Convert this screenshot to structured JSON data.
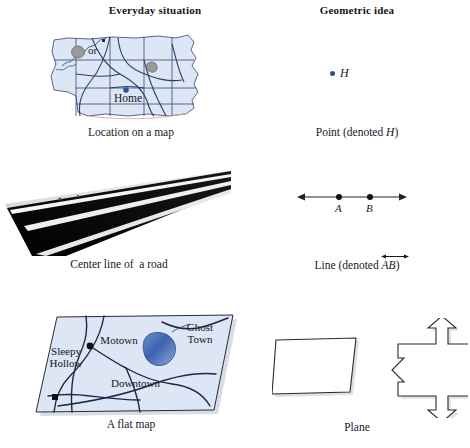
{
  "headers": {
    "everyday": "Everyday situation",
    "geometric": "Geometric idea"
  },
  "rows": [
    {
      "id": "point",
      "everyday_caption": "Location on a map",
      "geometric_caption_prefix": "Point (denoted ",
      "geometric_caption_symbol": "H",
      "geometric_caption_suffix": ")",
      "map": {
        "home_label": "Home",
        "home_dot_color": "#2d4f9e",
        "land_fill": "#dde6f4",
        "road_color": "#2b3d66",
        "lake_color": "#9a9a9a"
      },
      "point": {
        "label": "H",
        "dot_color": "#2d4f9e"
      }
    },
    {
      "id": "line",
      "everyday_caption": "Center line of  a road",
      "geometric_caption_prefix": "Line (denoted ",
      "geometric_caption_symbol": "AB",
      "geometric_caption_suffix": ")",
      "road": {
        "surface_color": "#090909",
        "lane_line_color": "#f4f4f4"
      },
      "line": {
        "point_a_label": "A",
        "point_b_label": "B",
        "stroke_color": "#232323"
      }
    },
    {
      "id": "plane",
      "everyday_caption": "A flat map",
      "geometric_caption": "Plane",
      "flat_map": {
        "labels": [
          "Sleepy Hollow",
          "Motown",
          "Ghost Town",
          "Downtown"
        ],
        "sleepy_hollow_line1": "Sleepy",
        "sleepy_hollow_line2": "Hollow",
        "motown": "Motown",
        "ghost_town_line1": "Ghost",
        "ghost_town_line2": "Town",
        "downtown": "Downtown",
        "land_fill": "#dde6f4",
        "lake_color": "#4a6cb0",
        "road_color": "#1b2742",
        "city_dot_color": "#111111"
      },
      "plane": {
        "or_text": "or",
        "outline_color": "#2b2b2b",
        "fill_color": "#ffffff"
      }
    }
  ],
  "bottom_artifact": ""
}
